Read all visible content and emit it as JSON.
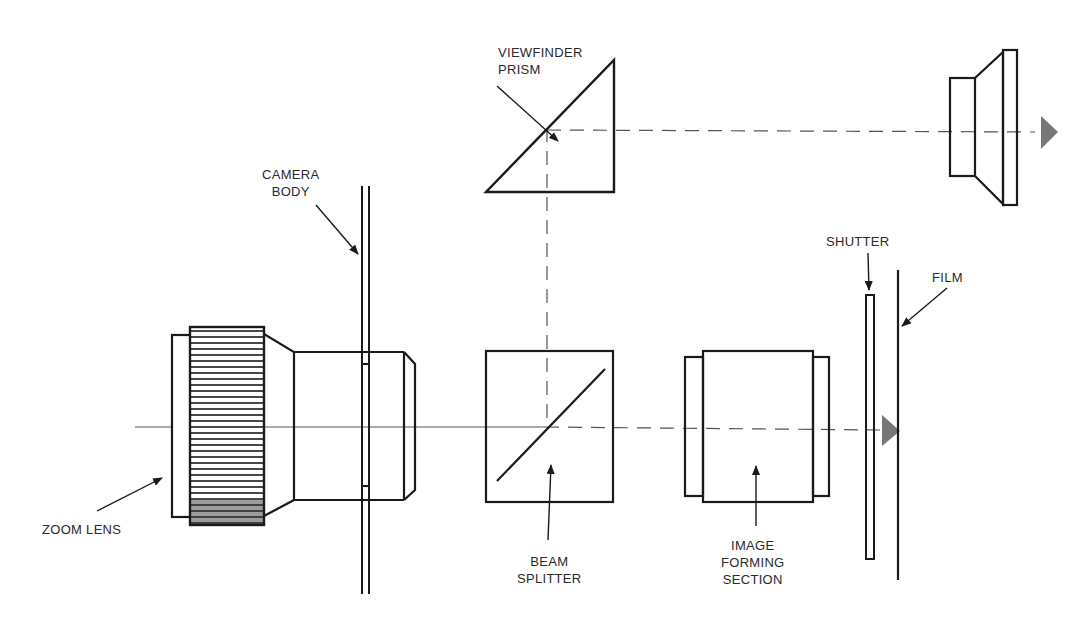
{
  "diagram": {
    "colors": {
      "line": "#1a1a1a",
      "axis": "#555555",
      "arrowhead": "#777777",
      "text": "#2a2a2a"
    },
    "labels": {
      "viewfinder_prism": {
        "line1": "VIEWFINDER",
        "line2": "PRISM"
      },
      "camera_body": {
        "line1": "CAMERA",
        "line2": "BODY"
      },
      "zoom_lens": {
        "line1": "ZOOM LENS"
      },
      "beam_splitter": {
        "line1": "BEAM",
        "line2": "SPLITTER"
      },
      "image_forming_section": {
        "line1": "IMAGE",
        "line2": "FORMING",
        "line3": "SECTION"
      },
      "shutter": {
        "line1": "SHUTTER"
      },
      "film": {
        "line1": "FILM"
      }
    },
    "components": [
      "zoom lens",
      "camera body",
      "beam splitter",
      "viewfinder prism",
      "eyepiece",
      "image forming section",
      "shutter",
      "film"
    ]
  }
}
